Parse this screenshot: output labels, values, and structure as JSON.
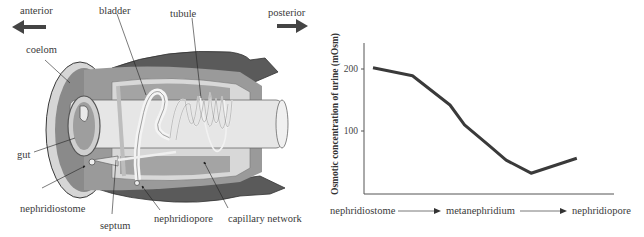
{
  "diagram": {
    "direction": {
      "anterior_label": "anterior",
      "posterior_label": "posterior"
    },
    "labels": {
      "bladder": "bladder",
      "tubule": "tubule",
      "coelom": "coelom",
      "gut": "gut",
      "nephridiostome": "nephridiostome",
      "septum": "septum",
      "nephridiopore": "nephridiopore",
      "capillary_network": "capillary network"
    },
    "colors": {
      "body_wall_dark": "#5a5a5a",
      "coelom_mid": "#8c8c8c",
      "light_tissue": "#dcdcdc",
      "gut_light": "#e8e8e8",
      "outline": "#3a3a3a",
      "arrow": "#444444"
    }
  },
  "chart_data": {
    "type": "line",
    "title": "",
    "ylabel": "Osmotic concentration of urine (mOsm)",
    "xlabel_sequence": [
      "nephridiostome",
      "metanephridium",
      "nephridiopore"
    ],
    "yticks": [
      100,
      200
    ],
    "ylim": [
      0,
      250
    ],
    "grid": false,
    "legend": null,
    "series": [
      {
        "name": "urine osmolarity",
        "x": [
          0.0,
          0.19,
          0.37,
          0.44,
          0.56,
          0.64,
          0.76,
          0.98
        ],
        "values": [
          202,
          189,
          142,
          110,
          76,
          53,
          32,
          56
        ]
      }
    ],
    "line_color": "#3a3a3a"
  }
}
